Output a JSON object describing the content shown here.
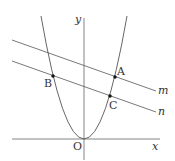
{
  "diagram": {
    "axes": {
      "x_label": "x",
      "y_label": "y",
      "origin_label": "O"
    },
    "curve": "parabola y = ax^2",
    "lines": [
      {
        "name": "m"
      },
      {
        "name": "n"
      }
    ],
    "points": [
      {
        "name": "A",
        "on": [
          "parabola",
          "m"
        ]
      },
      {
        "name": "B",
        "on": [
          "parabola",
          "n"
        ]
      },
      {
        "name": "C",
        "on": [
          "parabola",
          "n"
        ]
      }
    ],
    "colors": {
      "stroke": "#555555",
      "point": "#111111"
    }
  }
}
